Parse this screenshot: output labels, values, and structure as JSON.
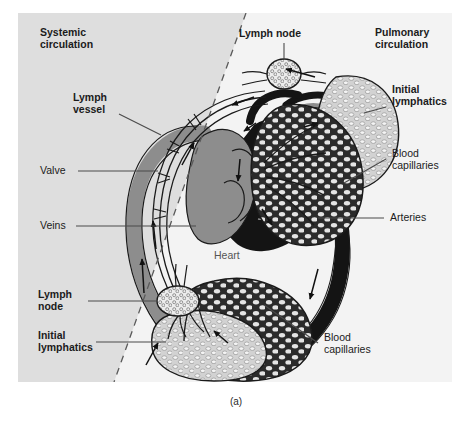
{
  "figure": {
    "caption": "(a)",
    "panel_background": "#dedede",
    "divider": "dashed diagonal separating systemic and pulmonary circulation"
  },
  "labels": {
    "systemic_circulation": "Systemic\ncirculation",
    "pulmonary_circulation": "Pulmonary\ncirculation",
    "lymph_vessel": "Lymph\nvessel",
    "lymph_node_top": "Lymph node",
    "lymph_node_left": "Lymph\nnode",
    "initial_lymphatics_right": "Initial\nlymphatics",
    "initial_lymphatics_left": "Initial\nlymphatics",
    "blood_capillaries_right": "Blood\ncapillaries",
    "blood_capillaries_bottom": "Blood\ncapillaries",
    "valve": "Valve",
    "veins": "Veins",
    "arteries": "Arteries",
    "heart": "Heart"
  },
  "colors": {
    "panel": "#dedede",
    "wedge": "#f2f2f2",
    "vein_gray": "#8d8d8d",
    "artery_black": "#141414",
    "lymph_fill": "#e8e8e8",
    "outline": "#1a1a1a",
    "capillary_dark": "#2a2a2a",
    "capillary_light": "#bdbdbd",
    "leader": "#4a4a4a"
  },
  "structures": [
    {
      "name": "heart",
      "style": "central four-chambered heart, dark arterial side and gray venous side"
    },
    {
      "name": "systemic-vein-arc",
      "style": "wide gray arc, left side, flow upward"
    },
    {
      "name": "systemic-artery-arc",
      "style": "wide black arc, right side, flow downward"
    },
    {
      "name": "lymph-vessel-left",
      "style": "thin valved lymph vessel paralleling the veins"
    },
    {
      "name": "lymph-node-top",
      "style": "ovoid node with internal follicle pattern"
    },
    {
      "name": "lymph-node-left",
      "style": "ovoid node with internal follicle pattern"
    },
    {
      "name": "pulmonary-capillary-bed",
      "style": "dark reticular capillary network, lung"
    },
    {
      "name": "pulmonary-initial-lymphatics",
      "style": "light reticular lymphatic network, lung"
    },
    {
      "name": "systemic-capillary-bed",
      "style": "dark reticular capillary network, body"
    },
    {
      "name": "systemic-initial-lymphatics",
      "style": "light reticular lymphatic network, body"
    }
  ]
}
